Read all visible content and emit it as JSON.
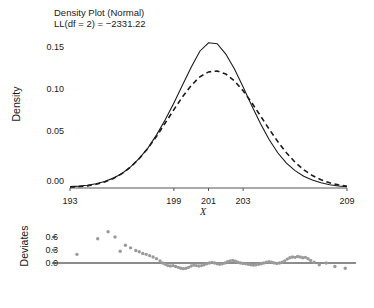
{
  "chart_data": {
    "type": "line",
    "title": "Density Plot (Normal)",
    "subtitle": "LL(df = 2) = −2331.22",
    "panels": [
      {
        "name": "density-panel",
        "ylabel": "Density",
        "xlabel": "X",
        "xlim": [
          193,
          209
        ],
        "ylim": [
          0.0,
          0.165
        ],
        "xticks": [
          193,
          199,
          201,
          203,
          209
        ],
        "xtick_labels": [
          "193",
          "199",
          "201",
          "203",
          "209"
        ],
        "yticks": [
          0.0,
          0.05,
          0.1,
          0.15
        ],
        "ytick_labels": [
          "0.00",
          "0.05",
          "0.10",
          "0.15"
        ],
        "grid": false,
        "legend": "none",
        "series": [
          {
            "name": "empirical-density",
            "style": "solid",
            "color": "#1a1a1a",
            "x": [
              193.0,
              193.5,
              194.0,
              194.5,
              195.0,
              195.5,
              196.0,
              196.5,
              197.0,
              197.5,
              198.0,
              198.5,
              199.0,
              199.5,
              200.0,
              200.5,
              201.0,
              201.5,
              202.0,
              202.5,
              203.0,
              203.5,
              204.0,
              204.5,
              205.0,
              205.5,
              206.0,
              206.5,
              207.0,
              207.5,
              208.0,
              208.5,
              209.0
            ],
            "y": [
              0.0015,
              0.002,
              0.003,
              0.0045,
              0.007,
              0.0105,
              0.0155,
              0.0225,
              0.0315,
              0.0425,
              0.0565,
              0.0725,
              0.0905,
              0.1095,
              0.1285,
              0.1455,
              0.1545,
              0.1535,
              0.1425,
              0.1265,
              0.1075,
              0.0875,
              0.0685,
              0.0515,
              0.0375,
              0.0265,
              0.0185,
              0.0125,
              0.0085,
              0.0055,
              0.0035,
              0.0022,
              0.0015
            ]
          },
          {
            "name": "fitted-normal-density",
            "style": "dashed",
            "color": "#1a1a1a",
            "mean": 201.0,
            "sd": 2.55,
            "x": [
              193.0,
              193.5,
              194.0,
              194.5,
              195.0,
              195.5,
              196.0,
              196.5,
              197.0,
              197.5,
              198.0,
              198.5,
              199.0,
              199.5,
              200.0,
              200.5,
              201.0,
              201.5,
              202.0,
              202.5,
              203.0,
              203.5,
              204.0,
              204.5,
              205.0,
              205.5,
              206.0,
              206.5,
              207.0,
              207.5,
              208.0,
              208.5,
              209.0
            ],
            "y": [
              0.0007,
              0.0013,
              0.0023,
              0.0039,
              0.0064,
              0.0101,
              0.0153,
              0.0223,
              0.0313,
              0.0423,
              0.0551,
              0.0691,
              0.0834,
              0.0971,
              0.1091,
              0.1182,
              0.1235,
              0.1245,
              0.1212,
              0.1139,
              0.1034,
              0.0907,
              0.0768,
              0.0627,
              0.0494,
              0.0375,
              0.0275,
              0.0194,
              0.0132,
              0.0087,
              0.0055,
              0.0033,
              0.0019
            ]
          }
        ]
      },
      {
        "name": "deviates-panel",
        "ylabel": "Deviates",
        "yticks": [
          0.0,
          0.3,
          0.6
        ],
        "ytick_labels": [
          "0.0",
          "0.3",
          "0.6"
        ],
        "zero_line": 0.0,
        "grid": false,
        "legend": "none",
        "series": [
          {
            "name": "deviates-scatter",
            "type": "scatter",
            "color": "#9a9a9a",
            "x": [
              193.4,
              194.6,
              195.2,
              195.6,
              195.9,
              196.2,
              196.5,
              196.8,
              197.0,
              197.2,
              197.4,
              197.6,
              197.8,
              198.0,
              198.2,
              198.35,
              198.5,
              198.65,
              198.8,
              198.95,
              199.1,
              199.25,
              199.4,
              199.55,
              199.7,
              199.85,
              200.0,
              200.15,
              200.3,
              200.45,
              200.6,
              200.75,
              200.9,
              201.05,
              201.2,
              201.35,
              201.5,
              201.65,
              201.8,
              201.95,
              202.1,
              202.25,
              202.4,
              202.55,
              202.7,
              202.85,
              203.0,
              203.15,
              203.3,
              203.45,
              203.6,
              203.75,
              203.9,
              204.05,
              204.2,
              204.35,
              204.5,
              204.65,
              204.8,
              204.95,
              205.1,
              205.25,
              205.4,
              205.55,
              205.7,
              205.85,
              206.0,
              206.15,
              206.3,
              206.45,
              206.6,
              206.75,
              206.9,
              207.1,
              207.4,
              207.8,
              208.3,
              208.9
            ],
            "y": [
              0.2,
              0.56,
              0.72,
              0.6,
              0.27,
              0.41,
              0.35,
              0.29,
              0.26,
              0.22,
              0.2,
              0.17,
              0.14,
              0.1,
              0.05,
              0.0,
              -0.03,
              -0.06,
              -0.07,
              -0.06,
              -0.08,
              -0.1,
              -0.12,
              -0.13,
              -0.12,
              -0.1,
              -0.07,
              -0.05,
              -0.06,
              -0.07,
              -0.06,
              -0.04,
              -0.02,
              0.0,
              0.01,
              0.0,
              -0.02,
              -0.03,
              -0.02,
              0.0,
              0.03,
              0.05,
              0.06,
              0.04,
              0.02,
              0.0,
              -0.01,
              -0.02,
              -0.03,
              -0.04,
              -0.05,
              -0.04,
              -0.03,
              -0.02,
              0.0,
              0.02,
              0.03,
              0.02,
              0.0,
              -0.01,
              0.0,
              0.02,
              0.05,
              0.09,
              0.12,
              0.14,
              0.13,
              0.15,
              0.14,
              0.12,
              0.13,
              0.1,
              0.06,
              0.02,
              -0.04,
              0.0,
              -0.08,
              -0.12
            ]
          }
        ]
      }
    ]
  },
  "labels": {
    "title1": "Density Plot (Normal)",
    "title2": "LL(df = 2) = −2331.22",
    "ylabel_density": "Density",
    "xlabel": "X",
    "ylabel_deviates": "Deviates",
    "ytick_015": "0.15",
    "ytick_010": "0.10",
    "ytick_005": "0.05",
    "ytick_000": "0.00",
    "xtick_193": "193",
    "xtick_199": "199",
    "xtick_201": "201",
    "xtick_203": "203",
    "xtick_209": "209",
    "dtick_06": "0.6",
    "dtick_03": "0.3",
    "dtick_00": "0.0"
  },
  "colors": {
    "line": "#1a1a1a",
    "points": "#9a9a9a",
    "axis": "#555555",
    "background": "#ffffff"
  }
}
